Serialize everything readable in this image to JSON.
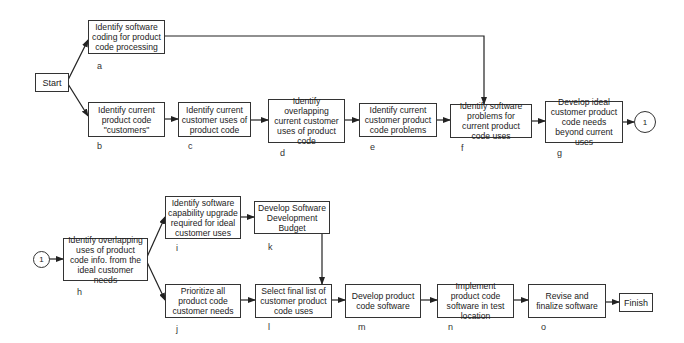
{
  "diagram": {
    "type": "flowchart",
    "start": "Start",
    "finish": "Finish",
    "connector": "1",
    "steps": {
      "a": {
        "id": "a",
        "text": "Identify software coding for product code processing"
      },
      "b": {
        "id": "b",
        "text": "Identify current product code \"customers\""
      },
      "c": {
        "id": "c",
        "text": "Identify current customer uses of product code"
      },
      "d": {
        "id": "d",
        "text": "Identify overlapping current customer uses of product code"
      },
      "e": {
        "id": "e",
        "text": "Identify current customer product code problems"
      },
      "f": {
        "id": "f",
        "text": "Identify software problems for current product code uses"
      },
      "g": {
        "id": "g",
        "text": "Develop ideal customer product code needs beyond current uses"
      },
      "h": {
        "id": "h",
        "text": "Identify overlapping uses of product code info. from the ideal customer needs"
      },
      "i": {
        "id": "i",
        "text": "Identify software capability upgrade required for ideal customer uses"
      },
      "j": {
        "id": "j",
        "text": "Prioritize all product code customer needs"
      },
      "k": {
        "id": "k",
        "text": "Develop Software Development Budget"
      },
      "l": {
        "id": "l",
        "text": "Select final list of customer product code uses"
      },
      "m": {
        "id": "m",
        "text": "Develop product code software"
      },
      "n": {
        "id": "n",
        "text": "Implement product code software in test location"
      },
      "o": {
        "id": "o",
        "text": "Revise and finalize software"
      }
    },
    "edges": [
      [
        "Start",
        "a"
      ],
      [
        "Start",
        "b"
      ],
      [
        "a",
        "f"
      ],
      [
        "b",
        "c"
      ],
      [
        "c",
        "d"
      ],
      [
        "d",
        "e"
      ],
      [
        "e",
        "f"
      ],
      [
        "f",
        "g"
      ],
      [
        "g",
        "1"
      ],
      [
        "1",
        "h"
      ],
      [
        "h",
        "i"
      ],
      [
        "h",
        "j"
      ],
      [
        "i",
        "k"
      ],
      [
        "k",
        "l"
      ],
      [
        "j",
        "l"
      ],
      [
        "l",
        "m"
      ],
      [
        "m",
        "n"
      ],
      [
        "n",
        "o"
      ],
      [
        "o",
        "Finish"
      ]
    ]
  }
}
